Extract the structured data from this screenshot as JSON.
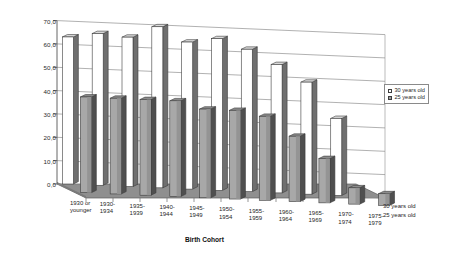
{
  "chart_data": {
    "type": "bar",
    "title": "",
    "subtitle": "",
    "xlabel": "Birth Cohort",
    "ylabel": "",
    "ylim": [
      0,
      70
    ],
    "ytick_step": 10,
    "ytick_labels": [
      "70,0",
      "60,0",
      "50,0",
      "40,0",
      "30,0",
      "20,0",
      "10,0",
      "0,0"
    ],
    "ytick_values": [
      70,
      60,
      50,
      40,
      30,
      20,
      10,
      0
    ],
    "grid": true,
    "legend_position": "right",
    "projection": "3d",
    "categories": [
      "1930 or\nyounger",
      "1930-\n1934",
      "1935-\n1939",
      "1940-\n1944",
      "1945-\n1949",
      "1950-\n1954",
      "1955-\n1959",
      "1960-\n1964",
      "1965-\n1969",
      "1970-\n1974",
      "1975-\n1979"
    ],
    "series": [
      {
        "name": "30 years old",
        "color": "#ffffff",
        "values": [
          63.0,
          65.0,
          64.0,
          69.0,
          63.0,
          65.0,
          61.0,
          55.0,
          48.0,
          33.0,
          0.0
        ]
      },
      {
        "name": "25 years old",
        "color": "#a8a8a8",
        "values": [
          41.0,
          41.0,
          41.0,
          41.0,
          38.0,
          38.0,
          36.0,
          28.0,
          19.0,
          7.0,
          5.0
        ]
      }
    ]
  },
  "legend": {
    "items": [
      {
        "label": "30 years old",
        "swatch": "white"
      },
      {
        "label": "25 years old",
        "swatch": "gray"
      }
    ]
  },
  "depth_axis": {
    "labels": [
      "30 years old",
      "25 years old"
    ]
  },
  "axis_titles": {
    "x": "Birth Cohort"
  }
}
